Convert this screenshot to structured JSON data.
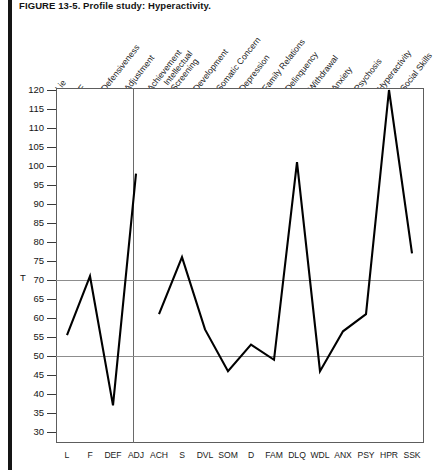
{
  "figure": {
    "title": "FIGURE 13-5.  Profile study: Hyperactivity.",
    "y_axis_label": "T"
  },
  "chart_data": {
    "type": "line",
    "title": "Profile study: Hyperactivity.",
    "xlabel": "",
    "ylabel": "T",
    "ylim": [
      28,
      122
    ],
    "yticks": [
      120,
      115,
      110,
      105,
      100,
      95,
      90,
      85,
      80,
      75,
      70,
      65,
      60,
      55,
      50,
      45,
      40,
      35,
      30
    ],
    "grid": true,
    "gridlines_y": [
      70,
      50
    ],
    "legend": "none",
    "categories": [
      "L",
      "F",
      "DEF",
      "ADJ",
      "ACH",
      "S",
      "DVL",
      "SOM",
      "D",
      "FAM",
      "DLQ",
      "WDL",
      "ANX",
      "PSY",
      "HPR",
      "SSK"
    ],
    "category_names": [
      "Lie",
      "F",
      "Defensiveness",
      "Adjustment",
      "Achievement",
      "Intellectual Screening",
      "Development",
      "Somatic Concern",
      "Depression",
      "Family Relations",
      "Delinquency",
      "Withdrawal",
      "Anxiety",
      "Psychosis",
      "Hyperactivity",
      "Social Skills"
    ],
    "values": [
      55.5,
      71,
      37,
      98,
      61,
      76,
      57,
      46,
      53,
      49,
      101,
      46,
      56.5,
      61,
      120,
      77
    ],
    "segments": [
      {
        "name": "validity-scales",
        "from": 0,
        "to": 3
      },
      {
        "name": "clinical-scales",
        "from": 4,
        "to": 15
      }
    ],
    "annotations": [
      "Vertical divider separates validity scales (L, F, DEF, ADJ) from clinical scales"
    ]
  },
  "top_labels": [
    {
      "text": "Lie",
      "lines": [
        "Lie"
      ]
    },
    {
      "text": "F",
      "lines": [
        "F"
      ]
    },
    {
      "text": "Defensiveness",
      "lines": [
        "Defensiveness"
      ]
    },
    {
      "text": "Adjustment",
      "lines": [
        "Adjustment"
      ]
    },
    {
      "text": "Achievement",
      "lines": [
        "Achievement"
      ]
    },
    {
      "text": "Intellectual Screening",
      "lines": [
        "Intellectual",
        "Screening"
      ]
    },
    {
      "text": "Development",
      "lines": [
        "Development"
      ]
    },
    {
      "text": "Somatic Concern",
      "lines": [
        "Somatic Concern"
      ]
    },
    {
      "text": "Depression",
      "lines": [
        "Depression"
      ]
    },
    {
      "text": "Family Relations",
      "lines": [
        "Family Relations"
      ]
    },
    {
      "text": "Delinquency",
      "lines": [
        "Delinquency"
      ]
    },
    {
      "text": "Withdrawal",
      "lines": [
        "Withdrawal"
      ]
    },
    {
      "text": "Anxiety",
      "lines": [
        "Anxiety"
      ]
    },
    {
      "text": "Psychosis",
      "lines": [
        "Psychosis"
      ]
    },
    {
      "text": "Hyperactivity",
      "lines": [
        "Hyperactivity"
      ]
    },
    {
      "text": "Social Skills",
      "lines": [
        "Social Skills"
      ]
    }
  ],
  "colors": {
    "line": "#000000",
    "frame": "#5d5d5d",
    "gridline": "#8d8d8d",
    "page_rule": "#151515",
    "text": "#141414"
  }
}
